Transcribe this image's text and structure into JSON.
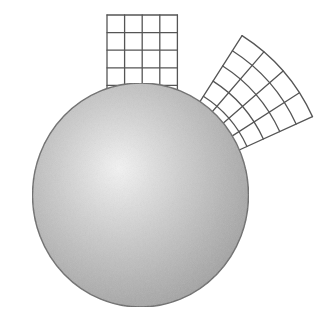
{
  "figure": {
    "colors": {
      "background": "#ffffff",
      "sphere_highlight": "#f4f4f4",
      "sphere_mid": "#cfcfcf",
      "sphere_edge": "#a4a4a4",
      "sphere_outline": "#6a6a6a",
      "grid_line": "#555555",
      "grid_fill": "#ffffff"
    },
    "sphere": {
      "label": "sphere"
    },
    "flat_grid": {
      "label": "flat square grid",
      "columns": 4,
      "rows": 4
    },
    "curved_grid": {
      "label": "curved radial grid",
      "columns": 4,
      "rows": 4.5
    }
  }
}
